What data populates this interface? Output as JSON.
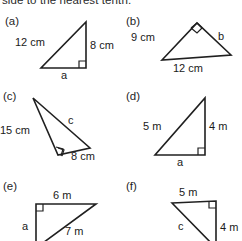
{
  "worksheet": {
    "instruction": "side to the nearest tenth.",
    "problems": [
      {
        "key": "a",
        "label": "(a)",
        "shape": "right-triangle",
        "right_angle_at": "bottom-right",
        "labels": {
          "hypotenuse": "12 cm",
          "vertical": "8 cm",
          "base": "a"
        }
      },
      {
        "key": "b",
        "label": "(b)",
        "shape": "right-triangle",
        "right_angle_at": "apex-top",
        "labels": {
          "left": "9 cm",
          "right": "b",
          "base": "12 cm"
        }
      },
      {
        "key": "c",
        "label": "(c)",
        "shape": "right-triangle",
        "right_angle_at": "bottom-left",
        "labels": {
          "left": "15 cm",
          "hypotenuse": "c",
          "base": "8 cm"
        }
      },
      {
        "key": "d",
        "label": "(d)",
        "shape": "right-triangle",
        "right_angle_at": "bottom-right",
        "labels": {
          "hypotenuse": "5 m",
          "vertical": "4 m",
          "base": "a"
        }
      },
      {
        "key": "e",
        "label": "(e)",
        "shape": "right-triangle",
        "right_angle_at": "top-left",
        "labels": {
          "top": "6 m",
          "vertical": "a",
          "hypotenuse": "7 m"
        }
      },
      {
        "key": "f",
        "label": "(f)",
        "shape": "right-triangle",
        "right_angle_at": "top-right",
        "labels": {
          "top": "5 m",
          "vertical": "4 m",
          "hypotenuse": "c"
        }
      }
    ]
  }
}
